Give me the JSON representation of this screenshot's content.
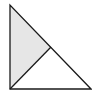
{
  "diagram": {
    "colors": {
      "stroke": "#1a1a1a",
      "shade": "#e6e6e6",
      "background": "#ffffff"
    },
    "shapes": [
      {
        "name": "outer-right-triangle",
        "filled": false
      },
      {
        "name": "shaded-sub-triangle",
        "filled": true
      },
      {
        "name": "dividing-segment",
        "filled": false
      }
    ]
  }
}
